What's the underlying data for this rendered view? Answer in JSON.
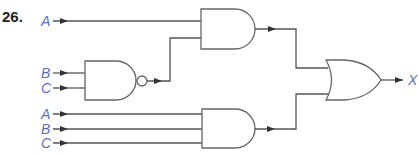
{
  "problem_number": "26.",
  "colors": {
    "label": "#5a6fc0",
    "wire": "#555555",
    "gate_stroke": "#666666"
  },
  "inputs": {
    "top_and": {
      "a": "A"
    },
    "nand": {
      "b": "B",
      "c": "C"
    },
    "bottom_and": {
      "a": "A",
      "b": "B",
      "c": "C"
    }
  },
  "gates": [
    {
      "id": "and-top",
      "type": "AND",
      "inputs": [
        "A",
        "NAND(B,C)"
      ]
    },
    {
      "id": "nand",
      "type": "NAND",
      "inputs": [
        "B",
        "C"
      ]
    },
    {
      "id": "and-bottom",
      "type": "AND",
      "inputs": [
        "A",
        "B",
        "C"
      ]
    },
    {
      "id": "or-output",
      "type": "OR",
      "inputs": [
        "and-top",
        "and-bottom"
      ]
    }
  ],
  "output": {
    "label": "X"
  }
}
